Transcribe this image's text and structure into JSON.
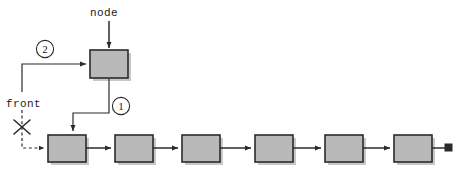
{
  "diagram": {
    "kind": "linked-list-insert-at-front",
    "canvas": {
      "width": 463,
      "height": 174,
      "background": "#ffffff"
    },
    "colors": {
      "node_fill": "#b9b9b9",
      "node_stroke": "#2b2b2b",
      "shadow": "#9a9a9a",
      "line": "#2b2b2b",
      "badge_fill": "#ffffff"
    },
    "labels": {
      "node_pointer": "node",
      "front_pointer": "front"
    },
    "steps": [
      {
        "id": "1",
        "badge": "1",
        "meaning": "new node next points to old front node"
      },
      {
        "id": "2",
        "badge": "2",
        "meaning": "front is reassigned to the new node"
      }
    ],
    "new_node": {
      "name": "new-node-box",
      "x": 90,
      "y": 50,
      "width": 38,
      "height": 28
    },
    "list_nodes": [
      {
        "index": 0,
        "x": 48,
        "y": 135,
        "width": 38,
        "height": 27
      },
      {
        "index": 1,
        "x": 115,
        "y": 135,
        "width": 38,
        "height": 27
      },
      {
        "index": 2,
        "x": 182,
        "y": 135,
        "width": 38,
        "height": 27
      },
      {
        "index": 3,
        "x": 255,
        "y": 135,
        "width": 38,
        "height": 27
      },
      {
        "index": 4,
        "x": 325,
        "y": 135,
        "width": 38,
        "height": 27
      },
      {
        "index": 5,
        "x": 394,
        "y": 135,
        "width": 38,
        "height": 27
      }
    ],
    "terminator": {
      "name": "null-terminator",
      "x": 445,
      "y": 144,
      "size": 7
    },
    "annotations": {
      "crossed_out_pointer": "front (old link, invalidated)",
      "dashed_means": "obsolete pointer"
    }
  }
}
